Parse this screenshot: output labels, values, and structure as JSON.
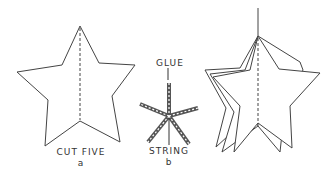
{
  "figure_a": {
    "caption": "CUT FIVE",
    "label": "a"
  },
  "figure_b": {
    "top_label": "GLUE",
    "bottom_label": "STRING",
    "label": "b"
  },
  "figure_c": {
    "description": "assembled 3D hanging star"
  },
  "colors": {
    "ink": "#333333",
    "background": "#ffffff"
  }
}
